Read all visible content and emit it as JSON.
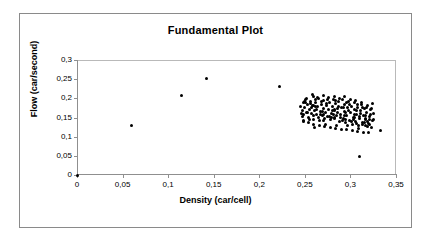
{
  "chart_data": {
    "type": "scatter",
    "title": "Fundamental Plot",
    "xlabel": "Density (car/cell)",
    "ylabel": "Flow (car/second)",
    "xlim": [
      0,
      0.35
    ],
    "ylim": [
      0,
      0.3
    ],
    "grid": false,
    "legend": null,
    "decimal_separator": ",",
    "marker": {
      "shape": "circle",
      "color": "#000000",
      "size": 3
    },
    "xticks": [
      0,
      0.05,
      0.1,
      0.15,
      0.2,
      0.25,
      0.3,
      0.35
    ],
    "xtick_labels": [
      "0",
      "0,05",
      "0,1",
      "0,15",
      "0,2",
      "0,25",
      "0,3",
      "0,35"
    ],
    "yticks": [
      0,
      0.05,
      0.1,
      0.15,
      0.2,
      0.25,
      0.3
    ],
    "ytick_labels": [
      "0",
      "0,05",
      "0,1",
      "0,15",
      "0,2",
      "0,25",
      "0,3"
    ],
    "series": [
      {
        "name": "Flow vs Density",
        "points": [
          [
            0.0,
            0.0
          ],
          [
            0.06,
            0.129
          ],
          [
            0.115,
            0.208
          ],
          [
            0.142,
            0.251
          ],
          [
            0.222,
            0.23
          ],
          [
            0.245,
            0.18
          ],
          [
            0.247,
            0.168
          ],
          [
            0.248,
            0.19
          ],
          [
            0.249,
            0.158
          ],
          [
            0.25,
            0.176
          ],
          [
            0.251,
            0.196
          ],
          [
            0.252,
            0.164
          ],
          [
            0.253,
            0.185
          ],
          [
            0.254,
            0.15
          ],
          [
            0.255,
            0.172
          ],
          [
            0.256,
            0.192
          ],
          [
            0.257,
            0.16
          ],
          [
            0.258,
            0.181
          ],
          [
            0.259,
            0.205
          ],
          [
            0.26,
            0.145
          ],
          [
            0.261,
            0.169
          ],
          [
            0.262,
            0.188
          ],
          [
            0.263,
            0.157
          ],
          [
            0.264,
            0.178
          ],
          [
            0.265,
            0.199
          ],
          [
            0.266,
            0.141
          ],
          [
            0.267,
            0.166
          ],
          [
            0.268,
            0.184
          ],
          [
            0.269,
            0.155
          ],
          [
            0.27,
            0.174
          ],
          [
            0.271,
            0.194
          ],
          [
            0.272,
            0.148
          ],
          [
            0.273,
            0.163
          ],
          [
            0.274,
            0.182
          ],
          [
            0.275,
            0.152
          ],
          [
            0.276,
            0.171
          ],
          [
            0.277,
            0.19
          ],
          [
            0.278,
            0.144
          ],
          [
            0.279,
            0.161
          ],
          [
            0.28,
            0.179
          ],
          [
            0.281,
            0.198
          ],
          [
            0.282,
            0.149
          ],
          [
            0.283,
            0.167
          ],
          [
            0.284,
            0.186
          ],
          [
            0.285,
            0.154
          ],
          [
            0.286,
            0.173
          ],
          [
            0.287,
            0.191
          ],
          [
            0.288,
            0.139
          ],
          [
            0.289,
            0.159
          ],
          [
            0.29,
            0.177
          ],
          [
            0.291,
            0.196
          ],
          [
            0.292,
            0.147
          ],
          [
            0.293,
            0.165
          ],
          [
            0.294,
            0.183
          ],
          [
            0.295,
            0.136
          ],
          [
            0.296,
            0.156
          ],
          [
            0.297,
            0.175
          ],
          [
            0.298,
            0.193
          ],
          [
            0.299,
            0.143
          ],
          [
            0.3,
            0.162
          ],
          [
            0.301,
            0.18
          ],
          [
            0.302,
            0.133
          ],
          [
            0.303,
            0.151
          ],
          [
            0.304,
            0.17
          ],
          [
            0.305,
            0.188
          ],
          [
            0.306,
            0.14
          ],
          [
            0.307,
            0.158
          ],
          [
            0.308,
            0.176
          ],
          [
            0.309,
            0.13
          ],
          [
            0.31,
            0.148
          ],
          [
            0.311,
            0.167
          ],
          [
            0.312,
            0.185
          ],
          [
            0.313,
            0.137
          ],
          [
            0.314,
            0.155
          ],
          [
            0.315,
            0.173
          ],
          [
            0.316,
            0.128
          ],
          [
            0.317,
            0.146
          ],
          [
            0.318,
            0.164
          ],
          [
            0.319,
            0.182
          ],
          [
            0.32,
            0.134
          ],
          [
            0.321,
            0.152
          ],
          [
            0.322,
            0.17
          ],
          [
            0.323,
            0.125
          ],
          [
            0.324,
            0.143
          ],
          [
            0.325,
            0.16
          ],
          [
            0.252,
            0.2
          ],
          [
            0.258,
            0.21
          ],
          [
            0.264,
            0.203
          ],
          [
            0.27,
            0.208
          ],
          [
            0.276,
            0.201
          ],
          [
            0.282,
            0.206
          ],
          [
            0.288,
            0.199
          ],
          [
            0.294,
            0.204
          ],
          [
            0.3,
            0.197
          ],
          [
            0.306,
            0.195
          ],
          [
            0.312,
            0.19
          ],
          [
            0.248,
            0.143
          ],
          [
            0.254,
            0.138
          ],
          [
            0.26,
            0.133
          ],
          [
            0.266,
            0.129
          ],
          [
            0.272,
            0.126
          ],
          [
            0.278,
            0.124
          ],
          [
            0.284,
            0.122
          ],
          [
            0.29,
            0.12
          ],
          [
            0.296,
            0.118
          ],
          [
            0.302,
            0.116
          ],
          [
            0.308,
            0.114
          ],
          [
            0.314,
            0.112
          ],
          [
            0.32,
            0.11
          ],
          [
            0.256,
            0.186
          ],
          [
            0.262,
            0.179
          ],
          [
            0.268,
            0.193
          ],
          [
            0.274,
            0.187
          ],
          [
            0.28,
            0.168
          ],
          [
            0.286,
            0.162
          ],
          [
            0.292,
            0.175
          ],
          [
            0.298,
            0.169
          ],
          [
            0.304,
            0.158
          ],
          [
            0.31,
            0.153
          ],
          [
            0.316,
            0.147
          ],
          [
            0.259,
            0.155
          ],
          [
            0.265,
            0.149
          ],
          [
            0.271,
            0.159
          ],
          [
            0.277,
            0.153
          ],
          [
            0.283,
            0.147
          ],
          [
            0.289,
            0.151
          ],
          [
            0.295,
            0.145
          ],
          [
            0.301,
            0.139
          ],
          [
            0.307,
            0.135
          ],
          [
            0.313,
            0.131
          ],
          [
            0.319,
            0.127
          ],
          [
            0.251,
            0.188
          ],
          [
            0.257,
            0.177
          ],
          [
            0.263,
            0.171
          ],
          [
            0.269,
            0.165
          ],
          [
            0.275,
            0.197
          ],
          [
            0.281,
            0.159
          ],
          [
            0.287,
            0.178
          ],
          [
            0.293,
            0.156
          ],
          [
            0.299,
            0.185
          ],
          [
            0.305,
            0.149
          ],
          [
            0.311,
            0.161
          ],
          [
            0.317,
            0.155
          ],
          [
            0.253,
            0.162
          ],
          [
            0.267,
            0.158
          ],
          [
            0.279,
            0.15
          ],
          [
            0.291,
            0.142
          ],
          [
            0.303,
            0.144
          ],
          [
            0.315,
            0.138
          ],
          [
            0.321,
            0.145
          ],
          [
            0.246,
            0.161
          ],
          [
            0.25,
            0.193
          ],
          [
            0.262,
            0.197
          ],
          [
            0.284,
            0.194
          ],
          [
            0.296,
            0.19
          ],
          [
            0.308,
            0.183
          ],
          [
            0.318,
            0.175
          ],
          [
            0.322,
            0.158
          ],
          [
            0.323,
            0.174
          ],
          [
            0.324,
            0.186
          ],
          [
            0.325,
            0.145
          ],
          [
            0.249,
            0.14
          ],
          [
            0.255,
            0.144
          ],
          [
            0.261,
            0.125
          ],
          [
            0.273,
            0.131
          ],
          [
            0.285,
            0.128
          ],
          [
            0.297,
            0.13
          ],
          [
            0.309,
            0.122
          ],
          [
            0.319,
            0.14
          ],
          [
            0.31,
            0.047
          ],
          [
            0.333,
            0.116
          ],
          [
            0.247,
            0.152
          ],
          [
            0.259,
            0.181
          ],
          [
            0.271,
            0.143
          ],
          [
            0.283,
            0.17
          ],
          [
            0.295,
            0.163
          ],
          [
            0.307,
            0.167
          ],
          [
            0.313,
            0.176
          ],
          [
            0.321,
            0.132
          ]
        ]
      }
    ]
  }
}
